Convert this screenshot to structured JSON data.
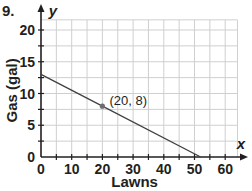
{
  "problem_number": "9.",
  "chart_data": {
    "type": "line",
    "title": "",
    "xlabel": "Lawns",
    "ylabel": "Gas (gal)",
    "x_axis_var": "x",
    "y_axis_var": "y",
    "xlim": [
      0,
      65
    ],
    "ylim": [
      0,
      22
    ],
    "x_ticks": [
      0,
      10,
      20,
      30,
      40,
      50,
      60
    ],
    "x_tick_labels": [
      "0",
      "10",
      "20",
      "30",
      "40",
      "50",
      "60"
    ],
    "y_ticks": [
      0,
      5,
      10,
      15,
      20
    ],
    "y_tick_labels": [
      "0",
      "5",
      "10",
      "15",
      "20"
    ],
    "grid": true,
    "series": [
      {
        "name": "gas remaining",
        "x": [
          0,
          20,
          52
        ],
        "y": [
          13,
          8,
          0
        ]
      }
    ],
    "annotations": [
      {
        "x": 20,
        "y": 8,
        "label": "(20, 8)"
      }
    ],
    "colors": {
      "line": "#414042",
      "grid": "#cfcfcf",
      "axis": "#231f20",
      "point": "#6d6e71"
    }
  }
}
